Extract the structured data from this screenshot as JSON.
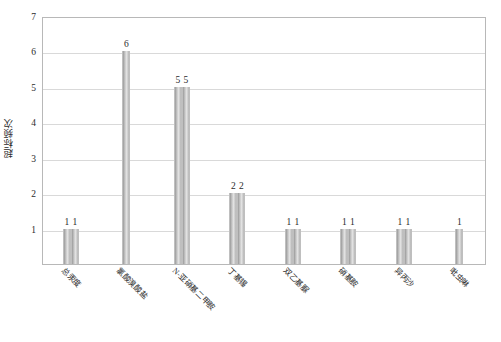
{
  "chart_data": {
    "type": "bar",
    "title": "",
    "subtitle": "",
    "xlabel": "",
    "ylabel": "超标频次",
    "ylim": [
      0,
      7
    ],
    "yticks": [
      1,
      2,
      3,
      4,
      5,
      6,
      7
    ],
    "grid": true,
    "legend": false,
    "legend_position": "none",
    "x_label_rotation": 45,
    "categories": [
      "总汞度",
      "氯酸溴酸盐",
      "N-亚硝基二甲胺",
      "丁基锡",
      "双乙基脲",
      "硝基胺",
      "异丙沙",
      "吡虫啉"
    ],
    "groups": [
      {
        "category": "总汞度",
        "values": [
          1,
          1
        ],
        "labels": [
          "1",
          "1"
        ]
      },
      {
        "category": "氯酸溴酸盐",
        "values": [
          6
        ],
        "labels": [
          "6"
        ]
      },
      {
        "category": "N-亚硝基二甲胺",
        "values": [
          5,
          5
        ],
        "labels": [
          "5",
          "5"
        ]
      },
      {
        "category": "丁基锡",
        "values": [
          2,
          2
        ],
        "labels": [
          "2",
          "2"
        ]
      },
      {
        "category": "双乙基脲",
        "values": [
          1,
          1
        ],
        "labels": [
          "1",
          "1"
        ]
      },
      {
        "category": "硝基胺",
        "values": [
          1,
          1
        ],
        "labels": [
          "1",
          "1"
        ]
      },
      {
        "category": "异丙沙",
        "values": [
          1,
          1
        ],
        "labels": [
          "1",
          "1"
        ]
      },
      {
        "category": "吡虫啉",
        "values": [
          1
        ],
        "labels": [
          "1"
        ]
      }
    ],
    "colors": {
      "bar_fill": "#c9c9c9",
      "bar_edge": "#bfbfbf",
      "gridline": "#d9d9d9",
      "plot_border": "#b8b8b8",
      "text": "#2b2b2b",
      "background": "#ffffff"
    }
  }
}
